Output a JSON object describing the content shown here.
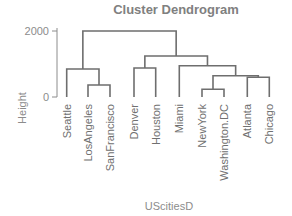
{
  "chart_data": {
    "type": "dendrogram",
    "title": "Cluster Dendrogram",
    "xlabel": "UScitiesD",
    "ylabel": "Height",
    "yticks": [
      0,
      2000
    ],
    "ylim": [
      0,
      2100
    ],
    "leaves": [
      "Seattle",
      "LosAngeles",
      "SanFrancisco",
      "Denver",
      "Houston",
      "Miami",
      "NewYork",
      "Washington.DC",
      "Atlanta",
      "Chicago"
    ],
    "merges": [
      {
        "members": [
          "NewYork",
          "Washington.DC"
        ],
        "height": 233
      },
      {
        "members": [
          "LosAngeles",
          "SanFrancisco"
        ],
        "height": 364
      },
      {
        "members": [
          "Atlanta",
          "Chicago"
        ],
        "height": 597
      },
      {
        "members": [
          "NewYork+Washington.DC",
          "Atlanta+Chicago"
        ],
        "height": 645
      },
      {
        "members": [
          "Seattle",
          "LosAngeles+SanFrancisco"
        ],
        "height": 848
      },
      {
        "members": [
          "Denver",
          "Houston"
        ],
        "height": 879
      },
      {
        "members": [
          "Miami",
          "NewYork+Washington.DC+Atlanta+Chicago"
        ],
        "height": 948
      },
      {
        "members": [
          "Denver+Houston",
          "Miami+..."
        ],
        "height": 1243
      },
      {
        "members": [
          "West cluster",
          "East/Central cluster"
        ],
        "height": 2000
      }
    ]
  },
  "layout": {
    "plot": {
      "y0_px": 97,
      "y2000_px": 31,
      "axis_x": 57
    },
    "leaf_x": [
      66.7,
      88,
      110,
      134,
      155.7,
      179.3,
      202,
      224,
      247.3,
      269.3
    ]
  }
}
